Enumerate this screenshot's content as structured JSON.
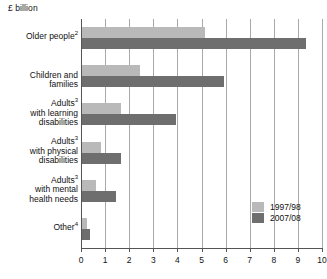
{
  "chart_data": {
    "type": "bar",
    "orientation": "horizontal",
    "title": "",
    "xlabel": "£ billion",
    "ylabel": "",
    "xlim": [
      0,
      10
    ],
    "xticks": [
      0,
      1,
      2,
      3,
      4,
      5,
      6,
      7,
      8,
      9,
      10
    ],
    "xtick_labels": [
      "0",
      "1",
      "2",
      "3",
      "4",
      "5",
      "6",
      "7",
      "8",
      "9",
      "10"
    ],
    "grid": true,
    "legend_position": "bottom-right",
    "categories": [
      "Older people2",
      "Children and families",
      "Adults3 with learning disabilities",
      "Adults3 with physical disabilities",
      "Adults3 with mental health needs",
      "Other4"
    ],
    "category_labels": [
      {
        "text": "Older people",
        "sup": "2",
        "lines": [
          "Older people"
        ]
      },
      {
        "text": "Children and families",
        "sup": "",
        "lines": [
          "Children and families"
        ]
      },
      {
        "text": "Adults with learning disabilities",
        "sup": "3",
        "lines": [
          "Adults",
          " with learning",
          "disabilities"
        ]
      },
      {
        "text": "Adults with physical disabilities",
        "sup": "3",
        "lines": [
          "Adults",
          " with physical",
          "disabilities"
        ]
      },
      {
        "text": "Adults with mental health needs",
        "sup": "3",
        "lines": [
          "Adults",
          " with mental",
          "health needs"
        ]
      },
      {
        "text": "Other",
        "sup": "4",
        "lines": [
          "Other"
        ]
      }
    ],
    "series": [
      {
        "name": "1997/98",
        "color": "#b9b9b9",
        "values": [
          5.1,
          2.4,
          1.6,
          0.8,
          0.6,
          0.2
        ]
      },
      {
        "name": "2007/08",
        "color": "#6e6e6e",
        "values": [
          9.3,
          5.9,
          3.9,
          1.6,
          1.4,
          0.35
        ]
      }
    ]
  },
  "legend": {
    "items": [
      {
        "label": "1997/98",
        "color": "#b9b9b9"
      },
      {
        "label": "2007/08",
        "color": "#6e6e6e"
      }
    ]
  },
  "footnote": {
    "text": ""
  }
}
